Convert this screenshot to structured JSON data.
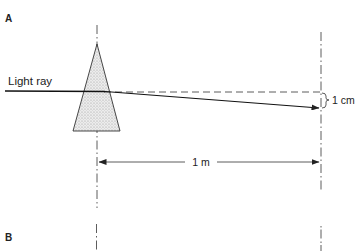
{
  "panels": [
    {
      "label": "A",
      "ray_label": "Light ray",
      "deviation_label": "1 cm",
      "distance_label": "1 m"
    },
    {
      "label": "B"
    }
  ],
  "colors": {
    "ink": "#222222",
    "prism_fill": "#d8d8d8"
  }
}
